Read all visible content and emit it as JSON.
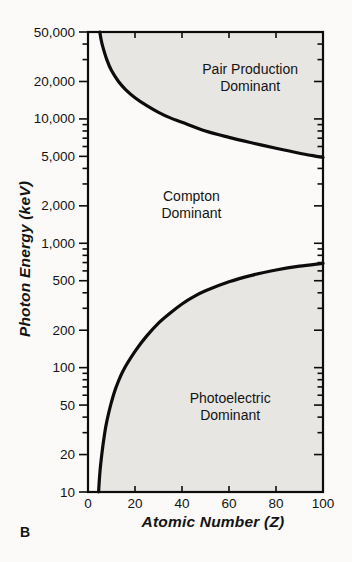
{
  "figure": {
    "panel_label": "B"
  },
  "chart_data": {
    "type": "area",
    "title": "",
    "xlabel": "Atomic Number (Z)",
    "ylabel": "Photon Energy (keV)",
    "x_axis": {
      "min": 0,
      "max": 100,
      "scale": "linear",
      "tick_values": [
        0,
        20,
        40,
        60,
        80,
        100
      ],
      "tick_labels": [
        "0",
        "20",
        "40",
        "60",
        "80",
        "100"
      ],
      "inner_tick_values": [
        20,
        40,
        60,
        80
      ]
    },
    "y_axis": {
      "min": 10,
      "max": 50000,
      "scale": "log",
      "tick_values": [
        10,
        20,
        50,
        100,
        200,
        500,
        1000,
        2000,
        5000,
        10000,
        20000,
        50000
      ],
      "tick_labels": [
        "10",
        "20",
        "50",
        "100",
        "200",
        "500",
        "1,000",
        "2,000",
        "5,000",
        "10,000",
        "20,000",
        "50,000"
      ],
      "minor_tick_values": [
        30,
        40,
        60,
        70,
        80,
        90,
        300,
        400,
        600,
        700,
        800,
        900,
        3000,
        4000,
        6000,
        7000,
        8000,
        9000,
        30000,
        40000
      ]
    },
    "grid": false,
    "legend": "none",
    "series": [
      {
        "name": "pair-production-compton-boundary",
        "description": "Boundary where pair production equals Compton scattering",
        "points": [
          [
            5,
            50000
          ],
          [
            6,
            40000
          ],
          [
            8,
            30000
          ],
          [
            10,
            24500
          ],
          [
            13,
            20000
          ],
          [
            16,
            17200
          ],
          [
            20,
            14800
          ],
          [
            25,
            12800
          ],
          [
            30,
            11300
          ],
          [
            35,
            10200
          ],
          [
            40,
            9400
          ],
          [
            50,
            8000
          ],
          [
            60,
            7100
          ],
          [
            70,
            6400
          ],
          [
            80,
            5800
          ],
          [
            90,
            5300
          ],
          [
            100,
            4900
          ]
        ]
      },
      {
        "name": "photoelectric-compton-boundary",
        "description": "Boundary where photoelectric effect equals Compton scattering",
        "points": [
          [
            4.5,
            10
          ],
          [
            5,
            14
          ],
          [
            6,
            21
          ],
          [
            7,
            29
          ],
          [
            8,
            37
          ],
          [
            10,
            53
          ],
          [
            12,
            70
          ],
          [
            15,
            95
          ],
          [
            20,
            135
          ],
          [
            25,
            180
          ],
          [
            30,
            228
          ],
          [
            35,
            275
          ],
          [
            40,
            325
          ],
          [
            45,
            372
          ],
          [
            50,
            415
          ],
          [
            60,
            490
          ],
          [
            70,
            555
          ],
          [
            80,
            610
          ],
          [
            90,
            655
          ],
          [
            100,
            690
          ]
        ]
      }
    ],
    "regions": [
      {
        "name": "pair-production-region",
        "label_lines": [
          "Pair Production",
          "Dominant"
        ],
        "bounded_by": "pair-production-compton-boundary",
        "side": "above",
        "shaded": true,
        "label_at": {
          "z": 69,
          "e": 21500
        }
      },
      {
        "name": "compton-region",
        "label_lines": [
          "Compton",
          "Dominant"
        ],
        "bounded_by": null,
        "side": "middle",
        "shaded": false,
        "label_at": {
          "z": 44,
          "e": 2050
        }
      },
      {
        "name": "photoelectric-region",
        "label_lines": [
          "Photoelectric",
          "Dominant"
        ],
        "bounded_by": "photoelectric-compton-boundary",
        "side": "below",
        "shaded": true,
        "label_at": {
          "z": 60.5,
          "e": 49
        }
      }
    ],
    "styles": {
      "region_fill": "#e7e6e3",
      "line_color": "#0c0c0c",
      "frame_color": "#0c0c0c",
      "text_color": "#141414",
      "background": "#fbfaf8"
    },
    "layout": {
      "plot_box": {
        "left": 88,
        "top": 32,
        "right": 323,
        "bottom": 492
      },
      "tick_len_major": 9,
      "tick_len_minor": 5.5,
      "tick_len_x_inner": 6
    }
  }
}
